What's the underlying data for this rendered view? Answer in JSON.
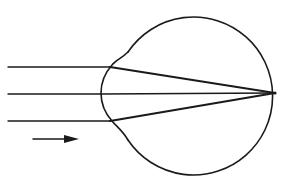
{
  "diagram": {
    "type": "optics-eye-refraction",
    "colors": {
      "line": "#1a1a1a",
      "background": "#ffffff"
    },
    "eyeball": {
      "cx": 194,
      "cy": 93,
      "r": 79
    },
    "cornea": {
      "top": [
        128,
        52
      ],
      "apex": [
        101,
        93
      ],
      "bottom": [
        128,
        140
      ]
    },
    "focal_point": [
      275,
      93
    ],
    "rays": [
      {
        "name": "upper",
        "y": 67,
        "x_start": 8,
        "x_refract": 110
      },
      {
        "name": "middle",
        "y": 94,
        "x_start": 8,
        "x_refract": 101
      },
      {
        "name": "lower",
        "y": 121,
        "x_start": 8,
        "x_refract": 110
      }
    ],
    "direction_arrow": {
      "x1": 33,
      "x2": 79,
      "y": 139,
      "label": "light direction"
    }
  }
}
